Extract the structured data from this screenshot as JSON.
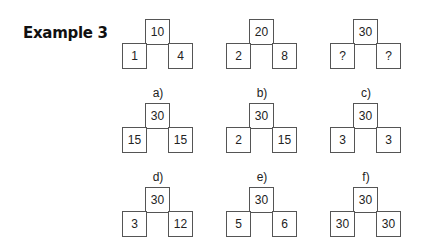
{
  "title": "Example 3",
  "examples": [
    {
      "top": "10",
      "left": "1",
      "right": "4"
    },
    {
      "top": "20",
      "left": "2",
      "right": "8"
    },
    {
      "top": "30",
      "left": "?",
      "right": "?"
    }
  ],
  "options": [
    {
      "label": "a)",
      "top": "30",
      "left": "15",
      "right": "15"
    },
    {
      "label": "b)",
      "top": "30",
      "left": "2",
      "right": "15"
    },
    {
      "label": "c)",
      "top": "30",
      "left": "3",
      "right": "3"
    },
    {
      "label": "d)",
      "top": "30",
      "left": "3",
      "right": "12"
    },
    {
      "label": "e)",
      "top": "30",
      "left": "5",
      "right": "6"
    },
    {
      "label": "f)",
      "top": "30",
      "left": "30",
      "right": "30"
    }
  ]
}
